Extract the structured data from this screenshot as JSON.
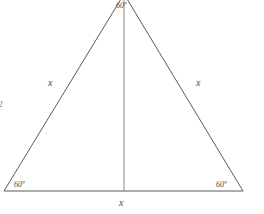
{
  "figure": {
    "type": "equilateral-triangle-with-altitude",
    "background_color": "#ffffff",
    "stroke_color": "#5a5a5a",
    "text_color": "#4a4a4a",
    "labels": {
      "angle_apex": "60º",
      "angle_bottom_left": "60º",
      "angle_bottom_right": "60º",
      "side_left": "x",
      "side_right": "x",
      "side_base": "x",
      "edge_fragment": "2"
    },
    "geometry": {
      "apex": [
        124,
        -6
      ],
      "bottom_left": [
        4,
        191
      ],
      "bottom_right": [
        243,
        191
      ],
      "altitude_foot": [
        124,
        191
      ]
    }
  }
}
